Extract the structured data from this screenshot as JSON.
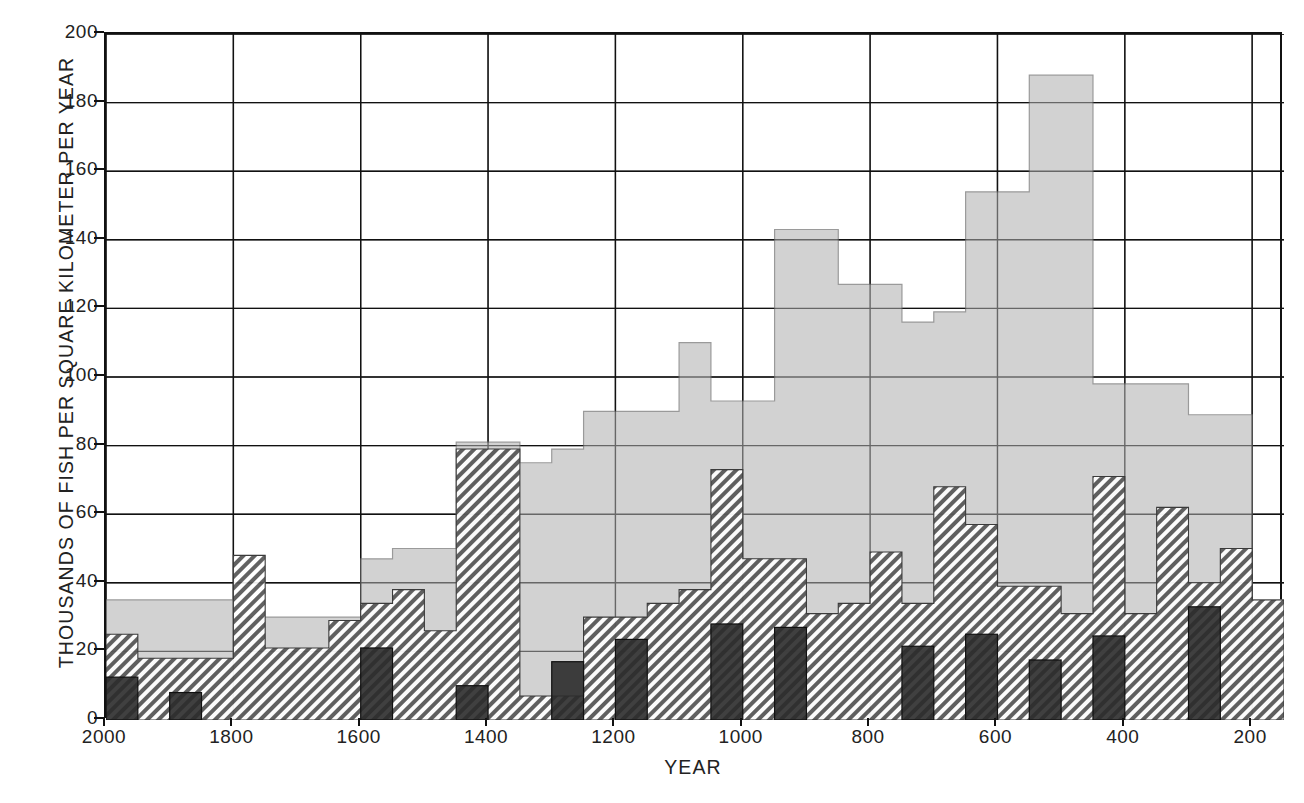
{
  "chart_data": {
    "type": "bar",
    "title": "",
    "xlabel": "YEAR",
    "ylabel": "THOUSANDS OF FISH PER SQUARE KILOMETER PER YEAR",
    "xlim": [
      2000,
      150
    ],
    "ylim": [
      0,
      200
    ],
    "x_tick_labels": [
      "2000",
      "1800",
      "1600",
      "1400",
      "1200",
      "1000",
      "800",
      "600",
      "400",
      "200"
    ],
    "x_tick_values": [
      2000,
      1800,
      1600,
      1400,
      1200,
      1000,
      800,
      600,
      400,
      200
    ],
    "y_tick_labels": [
      "0",
      "20",
      "40",
      "60",
      "80",
      "100",
      "120",
      "140",
      "160",
      "180",
      "200"
    ],
    "y_tick_values": [
      0,
      20,
      40,
      60,
      80,
      100,
      120,
      140,
      160,
      180,
      200
    ],
    "grid": true,
    "grid_x": true,
    "grid_y": true,
    "legend_position": "none",
    "bin_width_years": 50,
    "bin_starts": [
      2000,
      1950,
      1900,
      1850,
      1800,
      1750,
      1700,
      1650,
      1600,
      1550,
      1500,
      1450,
      1400,
      1350,
      1300,
      1250,
      1200,
      1150,
      1100,
      1050,
      1000,
      950,
      900,
      850,
      800,
      750,
      700,
      650,
      600,
      550,
      500,
      450,
      400,
      350,
      300,
      250,
      200
    ],
    "series": [
      {
        "name": "light-gray-area",
        "fill": "#d2d2d2",
        "pattern": "solid",
        "values": [
          35,
          35,
          35,
          35,
          30,
          30,
          30,
          30,
          47,
          50,
          50,
          81,
          81,
          75,
          79,
          90,
          90,
          90,
          110,
          93,
          93,
          143,
          143,
          127,
          127,
          116,
          119,
          154,
          154,
          188,
          188,
          98,
          98,
          98,
          89,
          89,
          35
        ]
      },
      {
        "name": "hatched-series",
        "fill": "#6e6e6e",
        "pattern": "diagonal-hatch",
        "values": [
          25,
          18,
          18,
          18,
          48,
          21,
          21,
          29,
          34,
          38,
          26,
          79,
          79,
          7,
          7,
          30,
          30,
          34,
          38,
          73,
          47,
          47,
          31,
          34,
          49,
          34,
          68,
          57,
          39,
          39,
          31,
          71,
          31,
          62,
          40,
          50,
          35
        ]
      },
      {
        "name": "dark-solid-series",
        "fill": "#2b2b2b",
        "pattern": "solid",
        "values": [
          12.5,
          0,
          8,
          0,
          0,
          0,
          0,
          0,
          21,
          0,
          0,
          10,
          0,
          0,
          17,
          0,
          23.5,
          0,
          0,
          28,
          0,
          27,
          0,
          0,
          0,
          21.5,
          0,
          25,
          0,
          17.5,
          0,
          24.5,
          0,
          0,
          33,
          0,
          0
        ]
      }
    ]
  },
  "figure": {
    "plot_left_px": 104,
    "plot_top_px": 32,
    "plot_width_px": 1178,
    "plot_height_px": 686
  }
}
